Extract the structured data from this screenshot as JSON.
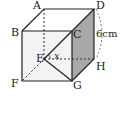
{
  "diagram": {
    "type": "cube",
    "vertices": {
      "A": "A",
      "B": "B",
      "C": "C",
      "D": "D",
      "E": "E",
      "F": "F",
      "G": "G",
      "H": "H"
    },
    "edge_length_label": "6cm",
    "angle_label": "x",
    "shaded_face": "CDHG",
    "colors": {
      "line": "#222222",
      "shade": "#a8a8a8",
      "front_face": "#f2f2f2"
    }
  }
}
